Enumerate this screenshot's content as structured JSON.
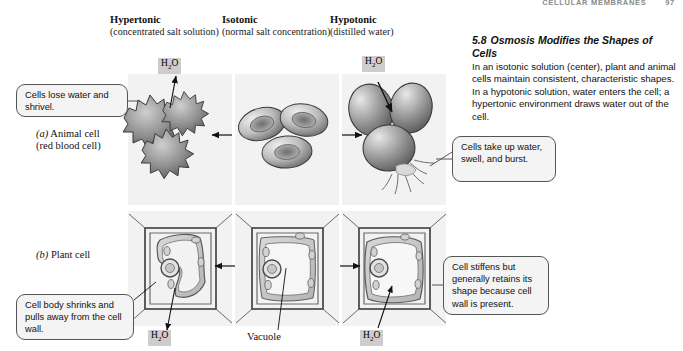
{
  "running_head": {
    "title": "CELLULAR MEMBRANES",
    "page": "97"
  },
  "columns": [
    {
      "id": "hypertonic",
      "title": "Hypertonic",
      "subtitle": "(concentrated salt solution)"
    },
    {
      "id": "isotonic",
      "title": "Isotonic",
      "subtitle": "(normal salt concentration)"
    },
    {
      "id": "hypotonic",
      "title": "Hypotonic",
      "subtitle": "(distilled water)"
    }
  ],
  "note": {
    "number": "5.8",
    "title": "Osmosis Modifies the Shapes of Cells",
    "body": "In an isotonic solution (center), plant and animal cells maintain consistent, characteristic shapes. In a hypotonic solution, water enters the cell; a hypertonic environment draws water out of the cell."
  },
  "rows": [
    {
      "id": "animal",
      "marker": "(a)",
      "label": "Animal cell",
      "sublabel": "(red blood cell)"
    },
    {
      "id": "plant",
      "marker": "(b)",
      "label": "Plant cell",
      "sublabel": ""
    }
  ],
  "labels": {
    "h2o": "H₂O",
    "h2o_text": "H2O",
    "vacuole": "Vacuole"
  },
  "callouts": [
    {
      "id": "shrivel",
      "text": "Cells lose water and shrivel."
    },
    {
      "id": "burst",
      "text": "Cells take up water, swell, and burst."
    },
    {
      "id": "stiffen",
      "text": "Cell stiffens but generally retains its shape because cell wall is present."
    },
    {
      "id": "pullaway",
      "text": "Cell body shrinks and pulls away from the cell wall."
    }
  ],
  "colors": {
    "panel_bg": "#f2f2f2",
    "tag_bg": "#cdcdcd",
    "callout_bg": "#f4f4f4",
    "callout_border": "#555555",
    "ink": "#111111",
    "runhead": "#8a8a8a"
  }
}
